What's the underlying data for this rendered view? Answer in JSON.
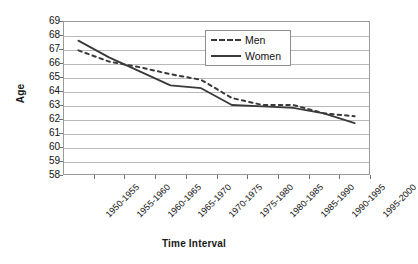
{
  "chart_data": {
    "type": "line",
    "title": "",
    "xlabel": "Time Interval",
    "ylabel": "Age",
    "ylim": [
      58,
      69
    ],
    "ytick_step": 1,
    "yticks": [
      69,
      68,
      67,
      66,
      65,
      64,
      63,
      62,
      61,
      60,
      59,
      58
    ],
    "grid": true,
    "legend_position": "top-right",
    "categories": [
      "1950-1955",
      "1955-1960",
      "1960-1965",
      "1965-1970",
      "1970-1975",
      "1975-1980",
      "1980-1985",
      "1985-1990",
      "1990-1995",
      "1995-2000"
    ],
    "series": [
      {
        "name": "Men",
        "style": "dashed",
        "color": "#3a3a3a",
        "values": [
          66.9,
          66.1,
          65.7,
          65.2,
          64.8,
          63.5,
          63.0,
          63.0,
          62.4,
          62.2
        ]
      },
      {
        "name": "Women",
        "style": "solid",
        "color": "#3a3a3a",
        "values": [
          67.6,
          66.4,
          65.4,
          64.4,
          64.2,
          63.0,
          62.9,
          62.8,
          62.4,
          61.7
        ]
      }
    ]
  },
  "axes": {
    "y_title": "Age",
    "x_title": "Time Interval"
  },
  "legend": {
    "entries": [
      {
        "label": "Men"
      },
      {
        "label": "Women"
      }
    ]
  }
}
